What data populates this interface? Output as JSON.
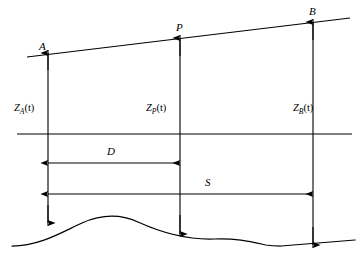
{
  "diagram": {
    "stroke_color": "#000000",
    "background_color": "#ffffff",
    "points": [
      {
        "id": "A",
        "label": "A",
        "x": 48,
        "label_x": 39,
        "label_y": 41
      },
      {
        "id": "P",
        "label": "P",
        "x": 180,
        "label_x": 176,
        "label_y": 22
      },
      {
        "id": "B",
        "label": "B",
        "x": 313,
        "label_x": 309,
        "label_y": 6
      }
    ],
    "elevations": [
      {
        "id": "ZA",
        "base": "Z",
        "subscript": "A",
        "arg": "(t)",
        "label_x": 14,
        "label_y": 103
      },
      {
        "id": "ZP",
        "base": "Z",
        "subscript": "P",
        "arg": "(t)",
        "label_x": 146,
        "label_y": 103
      },
      {
        "id": "ZB",
        "base": "Z",
        "subscript": "B",
        "arg": "(t)",
        "label_x": 293,
        "label_y": 103
      }
    ],
    "dimensions": [
      {
        "id": "D",
        "label": "D",
        "from_x": 48,
        "to_x": 180,
        "y": 163,
        "label_x": 107,
        "label_y": 146
      },
      {
        "id": "S",
        "label": "S",
        "from_x": 48,
        "to_x": 313,
        "y": 194,
        "label_x": 205,
        "label_y": 177
      }
    ],
    "datum_line": {
      "y": 134,
      "x1": 17,
      "x2": 352
    },
    "slope_line": {
      "x1": 27,
      "y1": 57,
      "x2": 350,
      "y2": 18
    },
    "terrain_path": "M 12 246 C 40 246 62 232 82 223 C 100 215 118 213 138 222 C 160 232 184 240 214 239 C 236 238 252 242 266 245 C 272 246 276 246 281 246 L 355 240"
  }
}
